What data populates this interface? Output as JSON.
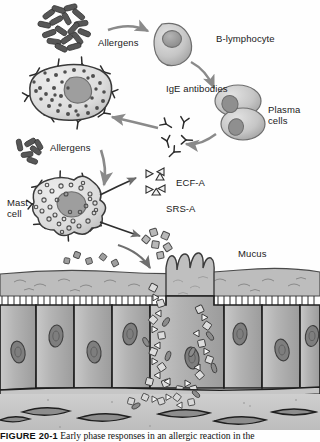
{
  "figure": {
    "title_label": "FIGURE 20-1",
    "caption_text": "  Early phase responses in an allergic reaction in the",
    "domain": "biology-illustration",
    "style": "grayscale textbook line drawing"
  },
  "labels": {
    "allergens_top": "Allergens",
    "allergens_left": "Allergens",
    "b_lymphocyte": "B-lymphocyte",
    "ige_antibodies": "IgE antibodies",
    "plasma_cells_line1": "Plasma",
    "plasma_cells_line2": "cells",
    "mast_cell_line1": "Mast",
    "mast_cell_line2": "cell",
    "ecf_a": "ECF-A",
    "srs_a": "SRS-A",
    "mucus": "Mucus"
  },
  "colors": {
    "ink": "#1a1a1a",
    "cell_fill_light": "#d8d8d8",
    "cell_fill_mid": "#b9b9b9",
    "cell_fill_dark": "#9a9a9a",
    "nucleus": "#8d8d8d",
    "allergen_dark": "#545454",
    "epithelium": "#b3b3b3",
    "mucus_layer": "#c2c2c2",
    "submucosa": "#c9c9c9",
    "arrow": "#8a8a8a",
    "background": "#ffffff"
  },
  "structures": {
    "allergen_cluster_top": {
      "name": "allergen-particles",
      "count": 17,
      "shape": "rod"
    },
    "allergen_cluster_left": {
      "name": "allergen-particles",
      "count": 6,
      "shape": "rod"
    },
    "b_lymphocyte": {
      "name": "b-lymphocyte-cell",
      "shape": "rounded-cell-with-nucleus"
    },
    "plasma_cells": {
      "name": "plasma-cells",
      "count": 2,
      "shape": "paired-oval-cells"
    },
    "free_ige": {
      "name": "free-ige-antibodies",
      "count": 5,
      "shape": "y-shape"
    },
    "mast_cell_top": {
      "name": "mast-cell-resting",
      "granules": 34,
      "receptors": 8
    },
    "mast_cell_bottom": {
      "name": "mast-cell-degranulating",
      "granules": 30,
      "receptors": 7
    },
    "ecf_a_particles": {
      "name": "ecf-a-granules",
      "count": 6,
      "shape": "triangle"
    },
    "histamine_particles": {
      "name": "histamine-granules",
      "count": 6,
      "shape": "square"
    },
    "epithelial_cells": {
      "name": "columnar-epithelial-cells",
      "count": 9
    },
    "goblet_cell": {
      "name": "goblet-cell",
      "projections": 4
    },
    "fibroblasts": {
      "name": "fibroblast-cells",
      "count": 6,
      "shape": "spindle"
    },
    "mediator_plume": {
      "name": "mediator-diffusion-plume",
      "particles": 46
    }
  },
  "arrows": [
    {
      "name": "arrow-allergens-to-b-lymphocyte",
      "from": "allergens_top",
      "to": "b_lymphocyte"
    },
    {
      "name": "arrow-b-lymphocyte-to-plasma-cells",
      "from": "b_lymphocyte",
      "to": "plasma_cells"
    },
    {
      "name": "arrow-plasma-cells-to-ige",
      "from": "plasma_cells",
      "to": "free_ige"
    },
    {
      "name": "arrow-ige-to-mast-cell",
      "from": "free_ige",
      "to": "mast_cell_top"
    },
    {
      "name": "arrow-allergens-to-mast-cell",
      "from": "allergens_left",
      "to": "mast_cell_bottom"
    },
    {
      "name": "arrow-mast-cell-to-ecf-a",
      "from": "mast_cell_bottom",
      "to": "ecf_a_particles"
    },
    {
      "name": "arrow-mast-cell-to-histamine",
      "from": "mast_cell_bottom",
      "to": "histamine_particles"
    },
    {
      "name": "arrow-mediators-to-epithelium",
      "from": "mast_cell_bottom",
      "to": "epithelium"
    }
  ]
}
